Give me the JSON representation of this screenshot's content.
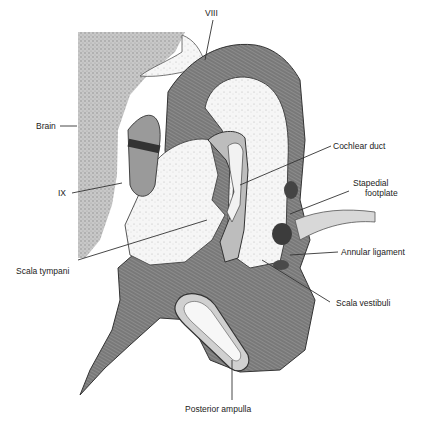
{
  "figure": {
    "labels": {
      "viii": "VIII",
      "brain": "Brain",
      "ix": "IX",
      "cochlear_duct": "Cochlear duct",
      "stapedial_footplate_1": "Stapedial",
      "stapedial_footplate_2": "footplate",
      "annular_ligament": "Annular ligament",
      "scala_tympani": "Scala tympani",
      "scala_vestibuli": "Scala vestibuli",
      "posterior_ampulla": "Posterior ampulla"
    },
    "colors": {
      "brain_stipple": "#b9b9b9",
      "bone_dark": "#7a7a7a",
      "membrane": "#9c9c9c",
      "fluid": "#f4f4f4",
      "ink": "#333333"
    }
  }
}
